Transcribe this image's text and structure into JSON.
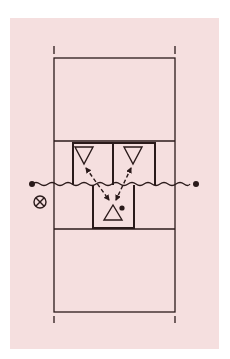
{
  "diagram": {
    "type": "badminton-court-formation",
    "colors": {
      "background": "#ffffff",
      "panel": "#f5dfdf",
      "line": "#2a1a1a"
    },
    "court": {
      "left": 54,
      "right": 175,
      "top": 58,
      "bottom": 312,
      "service_line_top": 141,
      "service_line_bottom": 229,
      "net_y": 185
    },
    "players": [
      {
        "id": "front-left",
        "symbol": "inverted-triangle",
        "team": "opponent"
      },
      {
        "id": "front-right",
        "symbol": "inverted-triangle",
        "team": "opponent"
      },
      {
        "id": "receiver",
        "symbol": "upright-triangle",
        "team": "own",
        "has_shuttle": true
      }
    ],
    "markers": [
      {
        "id": "target-marker",
        "symbol": "circled-x"
      }
    ],
    "arrows": [
      {
        "from": "receiver",
        "to": "front-left",
        "style": "dashed-bidirectional"
      },
      {
        "from": "receiver",
        "to": "front-right",
        "style": "dashed-bidirectional"
      }
    ]
  }
}
